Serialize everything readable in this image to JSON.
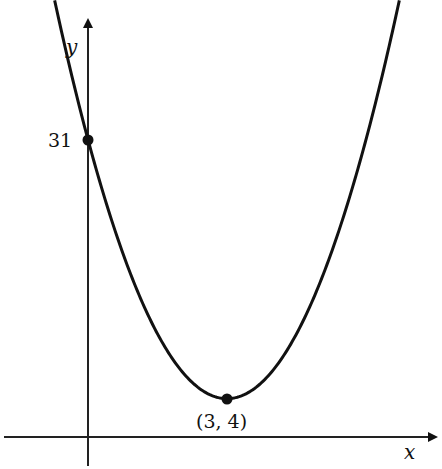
{
  "chart_data": {
    "type": "line",
    "title": "",
    "function": "y = 3(x - 3)^2 + 4",
    "xlabel": "x",
    "ylabel": "y",
    "xlim": [
      -1.9,
      7.6
    ],
    "ylim": [
      -3.3,
      45.5
    ],
    "grid": false,
    "legend": null,
    "series": [
      {
        "name": "parabola",
        "x": [
          -0.7,
          0,
          1,
          2,
          3,
          4,
          5,
          6,
          6.7
        ],
        "y": [
          45.1,
          31,
          16,
          7,
          4,
          7,
          16,
          31,
          45.1
        ]
      }
    ],
    "points": [
      {
        "x": 0,
        "y": 31,
        "label": "31"
      },
      {
        "x": 3,
        "y": 4,
        "label": "(3, 4)"
      }
    ],
    "annotations": [
      "31",
      "(3, 4)"
    ]
  },
  "labels": {
    "x_axis": "x",
    "y_axis": "y",
    "y_intercept": "31",
    "vertex": "(3, 4)"
  },
  "colors": {
    "curve": "#111111",
    "axes": "#222222",
    "background": "#ffffff"
  }
}
